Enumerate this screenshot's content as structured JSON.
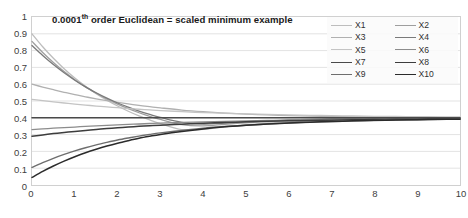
{
  "chart_data": {
    "type": "line",
    "title": "0.0001th order Euclidean = scaled minimum example",
    "title_main": "0.0001",
    "title_sup": "th",
    "title_rest": " order Euclidean = scaled minimum example",
    "xlabel": "",
    "ylabel": "",
    "xlim": [
      0,
      10
    ],
    "ylim": [
      0,
      1
    ],
    "grid": "horizontal",
    "legend_position": "top-right",
    "legend_columns": 2,
    "x_ticks": [
      "0",
      "1",
      "2",
      "3",
      "4",
      "5",
      "6",
      "7",
      "8",
      "9",
      "10"
    ],
    "y_ticks": [
      "1",
      "0.9",
      "0.8",
      "0.7",
      "0.6",
      "0.5",
      "0.4",
      "0.3",
      "0.2",
      "0.1",
      "0"
    ],
    "x": [
      0,
      0.25,
      0.5,
      0.75,
      1,
      1.25,
      1.5,
      1.75,
      2,
      2.25,
      2.5,
      2.75,
      3,
      3.5,
      4,
      4.5,
      5,
      5.5,
      6,
      6.5,
      7,
      7.5,
      8,
      8.5,
      9,
      9.5,
      10
    ],
    "converges_to": 0.4,
    "series": [
      {
        "name": "X1",
        "color": "#bdbdbd",
        "width": 1.3,
        "start": 0.9,
        "values": [
          0.9,
          0.823,
          0.754,
          0.692,
          0.637,
          0.588,
          0.544,
          0.505,
          0.47,
          0.439,
          0.411,
          0.387,
          0.365,
          0.329,
          0.331,
          0.346,
          0.358,
          0.368,
          0.376,
          0.382,
          0.387,
          0.39,
          0.393,
          0.395,
          0.397,
          0.398,
          0.4
        ]
      },
      {
        "name": "X2",
        "color": "#9e9e9e",
        "width": 1.3,
        "start": 0.855,
        "values": [
          0.855,
          0.789,
          0.729,
          0.675,
          0.627,
          0.584,
          0.546,
          0.512,
          0.481,
          0.454,
          0.43,
          0.409,
          0.39,
          0.359,
          0.352,
          0.361,
          0.37,
          0.378,
          0.384,
          0.388,
          0.391,
          0.394,
          0.396,
          0.397,
          0.398,
          0.399,
          0.4
        ]
      },
      {
        "name": "X3",
        "color": "#b0b0b0",
        "width": 1.3,
        "start": 0.6,
        "values": [
          0.6,
          0.583,
          0.567,
          0.552,
          0.538,
          0.525,
          0.513,
          0.502,
          0.492,
          0.483,
          0.474,
          0.466,
          0.459,
          0.446,
          0.436,
          0.428,
          0.422,
          0.417,
          0.413,
          0.41,
          0.408,
          0.406,
          0.405,
          0.404,
          0.403,
          0.402,
          0.401
        ]
      },
      {
        "name": "X4",
        "color": "#7a7a7a",
        "width": 1.3,
        "start": 0.83,
        "values": [
          0.83,
          0.771,
          0.717,
          0.668,
          0.624,
          0.584,
          0.549,
          0.517,
          0.488,
          0.463,
          0.44,
          0.42,
          0.402,
          0.373,
          0.363,
          0.369,
          0.376,
          0.382,
          0.387,
          0.39,
          0.393,
          0.395,
          0.397,
          0.398,
          0.399,
          0.399,
          0.4
        ]
      },
      {
        "name": "X5",
        "color": "#c4c4c4",
        "width": 1.3,
        "start": 0.51,
        "values": [
          0.51,
          0.502,
          0.495,
          0.488,
          0.482,
          0.476,
          0.47,
          0.465,
          0.46,
          0.455,
          0.451,
          0.447,
          0.443,
          0.437,
          0.431,
          0.427,
          0.423,
          0.42,
          0.417,
          0.415,
          0.413,
          0.411,
          0.409,
          0.408,
          0.407,
          0.406,
          0.405
        ]
      },
      {
        "name": "X6",
        "color": "#8c8c8c",
        "width": 1.3,
        "start": 0.33,
        "values": [
          0.33,
          0.334,
          0.338,
          0.342,
          0.345,
          0.349,
          0.352,
          0.355,
          0.358,
          0.361,
          0.363,
          0.366,
          0.368,
          0.372,
          0.376,
          0.379,
          0.382,
          0.384,
          0.386,
          0.388,
          0.39,
          0.391,
          0.392,
          0.394,
          0.395,
          0.395,
          0.396
        ]
      },
      {
        "name": "X7",
        "color": "#4a4a4a",
        "width": 1.5,
        "start": 0.4,
        "values": [
          0.4,
          0.4,
          0.4,
          0.4,
          0.4,
          0.4,
          0.4,
          0.4,
          0.4,
          0.4,
          0.4,
          0.4,
          0.4,
          0.4,
          0.4,
          0.4,
          0.4,
          0.4,
          0.4,
          0.4,
          0.4,
          0.4,
          0.4,
          0.4,
          0.4,
          0.4,
          0.4
        ]
      },
      {
        "name": "X8",
        "color": "#3d3d3d",
        "width": 1.5,
        "start": 0.29,
        "values": [
          0.29,
          0.298,
          0.306,
          0.313,
          0.319,
          0.325,
          0.331,
          0.336,
          0.341,
          0.345,
          0.349,
          0.353,
          0.356,
          0.362,
          0.368,
          0.372,
          0.376,
          0.379,
          0.382,
          0.384,
          0.386,
          0.388,
          0.39,
          0.391,
          0.392,
          0.393,
          0.394
        ]
      },
      {
        "name": "X9",
        "color": "#6e6e6e",
        "width": 1.4,
        "start": 0.105,
        "values": [
          0.105,
          0.133,
          0.159,
          0.182,
          0.203,
          0.222,
          0.239,
          0.254,
          0.268,
          0.28,
          0.291,
          0.301,
          0.31,
          0.325,
          0.338,
          0.348,
          0.356,
          0.363,
          0.369,
          0.374,
          0.378,
          0.381,
          0.384,
          0.386,
          0.388,
          0.39,
          0.392
        ]
      },
      {
        "name": "X10",
        "color": "#2b2b2b",
        "width": 1.5,
        "start": 0.045,
        "values": [
          0.045,
          0.081,
          0.113,
          0.142,
          0.168,
          0.192,
          0.213,
          0.232,
          0.249,
          0.264,
          0.278,
          0.29,
          0.301,
          0.319,
          0.334,
          0.346,
          0.355,
          0.363,
          0.369,
          0.374,
          0.378,
          0.382,
          0.385,
          0.387,
          0.389,
          0.391,
          0.392
        ]
      }
    ],
    "legend_entries": [
      "X1",
      "X2",
      "X3",
      "X4",
      "X5",
      "X6",
      "X7",
      "X8",
      "X9",
      "X10"
    ],
    "colors": {
      "grid": "#e3e3e3",
      "border": "#d0d0d0",
      "tick_text": "#404040",
      "title_text": "#1a1a1a",
      "background": "#ffffff"
    }
  }
}
